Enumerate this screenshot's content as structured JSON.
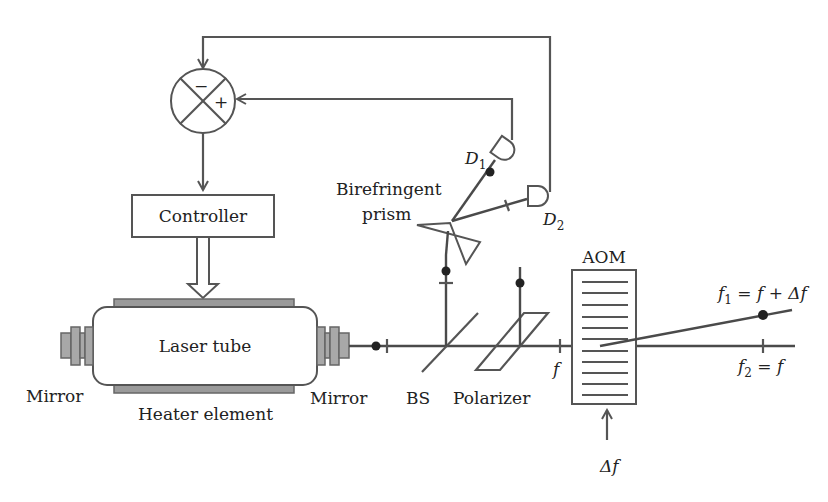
{
  "diagram": {
    "summing_junction": {
      "minus": "−",
      "plus": "+"
    },
    "controller": {
      "label": "Controller"
    },
    "laser_tube": {
      "label": "Laser tube"
    },
    "heater": {
      "label": "Heater element"
    },
    "mirror_left": {
      "label": "Mirror"
    },
    "mirror_right": {
      "label": "Mirror"
    },
    "beam_splitter": {
      "label": "BS"
    },
    "polarizer": {
      "label": "Polarizer"
    },
    "prism": {
      "label_line1": "Birefringent",
      "label_line2": "prism"
    },
    "detector1": {
      "label": "D",
      "sub": "1"
    },
    "detector2": {
      "label": "D",
      "sub": "2"
    },
    "aom": {
      "label": "AOM",
      "grating_lines": 11
    },
    "beam_input": {
      "label": "f"
    },
    "modulation_input": {
      "label": "Δf"
    },
    "output_beam1": {
      "label_f": "f",
      "sub": "1",
      "eq": " = f + Δf"
    },
    "output_beam2": {
      "label_f": "f",
      "sub": "2",
      "eq": " = f"
    }
  },
  "colors": {
    "line": "#555555",
    "beam": "#4a4a4a",
    "fill_component": "#9a9a9a",
    "text": "#222222"
  }
}
